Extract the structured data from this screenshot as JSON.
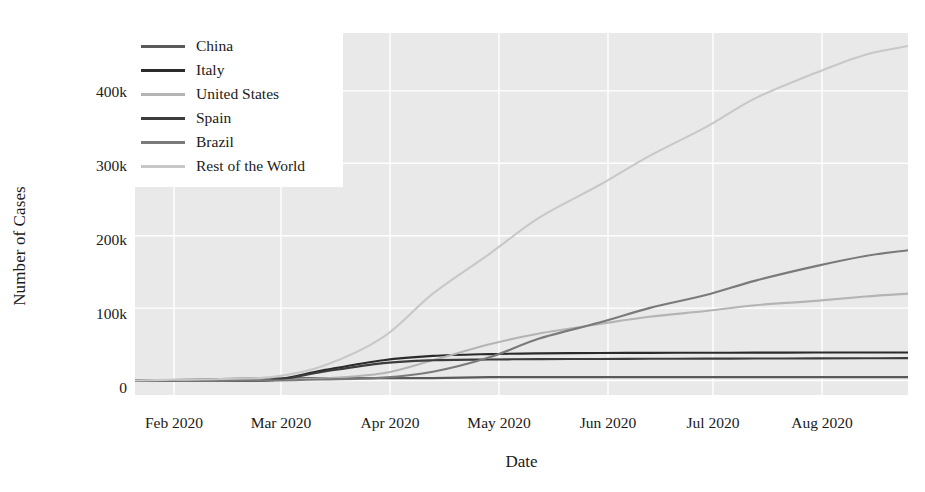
{
  "chart_data": {
    "type": "line",
    "title": "",
    "xlabel": "Date",
    "ylabel": "Number of Cases",
    "grid": true,
    "legend_position": "upper-left",
    "xlim": [
      "2020-01-22",
      "2020-08-27"
    ],
    "ylim": [
      -20000,
      480000
    ],
    "x_tick_labels": [
      "Feb 2020",
      "Mar 2020",
      "Apr 2020",
      "May 2020",
      "Jun 2020",
      "Jul 2020",
      "Aug 2020"
    ],
    "y_tick_labels": [
      "0",
      "100k",
      "200k",
      "300k",
      "400k"
    ],
    "y_tick_values": [
      0,
      100000,
      200000,
      300000,
      400000
    ],
    "x": [
      "2020-01-22",
      "2020-02-01",
      "2020-02-15",
      "2020-03-01",
      "2020-03-15",
      "2020-04-01",
      "2020-04-15",
      "2020-05-01",
      "2020-05-15",
      "2020-06-01",
      "2020-06-15",
      "2020-07-01",
      "2020-07-15",
      "2020-08-01",
      "2020-08-15",
      "2020-08-27"
    ],
    "series": [
      {
        "name": "China",
        "color": "#5a5a5a",
        "values": [
          0,
          500,
          2000,
          3000,
          3300,
          3340,
          3350,
          4640,
          4640,
          4650,
          4650,
          4660,
          4660,
          4700,
          4720,
          4730
        ]
      },
      {
        "name": "Italy",
        "color": "#2b2b2b",
        "values": [
          0,
          0,
          100,
          1000,
          14000,
          28000,
          34000,
          36500,
          37500,
          38000,
          38200,
          38400,
          38500,
          38600,
          38700,
          38800
        ]
      },
      {
        "name": "United States",
        "color": "#b4b4b4",
        "values": [
          0,
          0,
          100,
          500,
          3000,
          10000,
          28000,
          50000,
          65000,
          78000,
          88000,
          96000,
          104000,
          110000,
          116000,
          120000
        ]
      },
      {
        "name": "Spain",
        "color": "#3c3c3c",
        "values": [
          0,
          0,
          50,
          600,
          12000,
          24000,
          28000,
          29000,
          29500,
          29800,
          30000,
          30200,
          30400,
          30600,
          30800,
          31000
        ]
      },
      {
        "name": "Brazil",
        "color": "#7a7a7a",
        "values": [
          0,
          0,
          0,
          100,
          1500,
          4000,
          12000,
          32000,
          58000,
          80000,
          100000,
          118000,
          138000,
          158000,
          172000,
          180000
        ]
      },
      {
        "name": "Rest of the World",
        "color": "#c8c8c8",
        "values": [
          0,
          1000,
          2000,
          5000,
          20000,
          60000,
          120000,
          175000,
          225000,
          270000,
          310000,
          350000,
          390000,
          425000,
          450000,
          462000
        ]
      }
    ]
  }
}
